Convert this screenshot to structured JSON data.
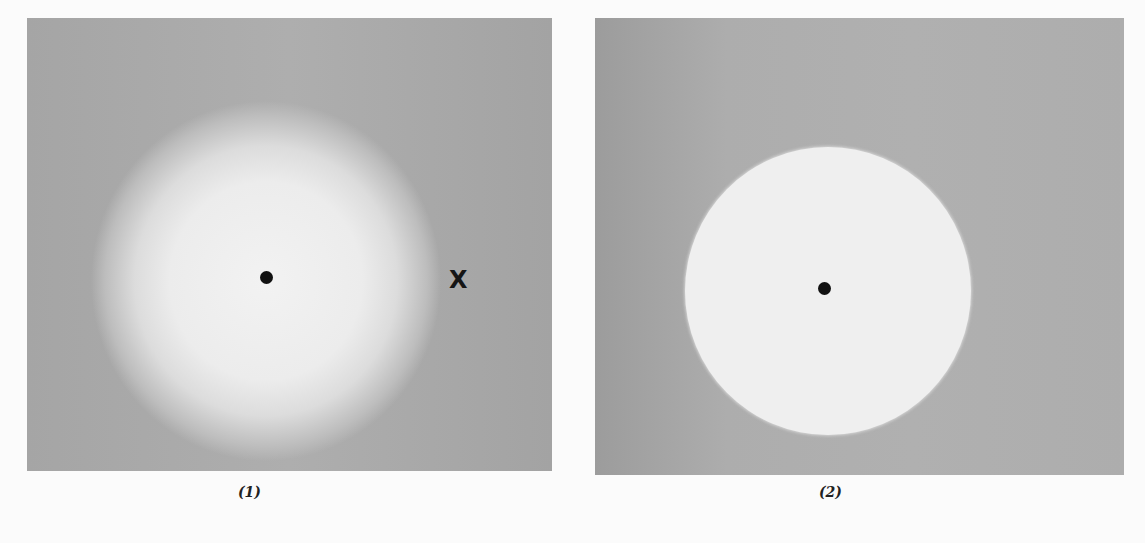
{
  "figure": {
    "panels": [
      {
        "id": "1",
        "caption": "(1)",
        "description": "Diffuse bright glowing region on gray background with central black dot; X mark to the right",
        "marker_label": "X",
        "colors": {
          "background": "#a9a9a9",
          "glow": "#f0f0f0",
          "dot": "#111111"
        }
      },
      {
        "id": "2",
        "caption": "(2)",
        "description": "Sharp-edged bright circular disk on gray background with central black dot",
        "colors": {
          "background": "#adadad",
          "disk": "#efefef",
          "dot": "#111111"
        }
      }
    ]
  }
}
